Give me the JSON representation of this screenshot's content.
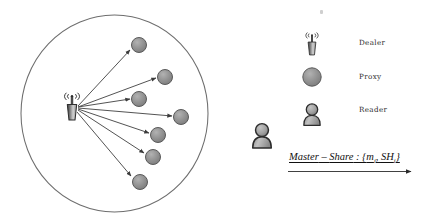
{
  "diagram": {
    "coverage_area": {
      "name": "dealer-coverage-circle",
      "cx": 114.5,
      "cy": 113.5,
      "rx": 93.5,
      "ry": 98.5,
      "stroke": "#6e6e6e",
      "fill": "#ffffff"
    },
    "dealer": {
      "label": "Dealer",
      "x": 72,
      "y": 108,
      "icon": "radio-tower-icon"
    },
    "proxies": {
      "label": "Proxy",
      "icon": "proxy-circle-icon",
      "fill": "#8d8d8d",
      "stroke": "#5a5a5a",
      "radius": 7.5,
      "nodes": [
        {
          "id": "proxy-1",
          "x": 139,
          "y": 45
        },
        {
          "id": "proxy-2",
          "x": 165,
          "y": 77
        },
        {
          "id": "proxy-3",
          "x": 139,
          "y": 99
        },
        {
          "id": "proxy-4",
          "x": 181,
          "y": 117
        },
        {
          "id": "proxy-5",
          "x": 158,
          "y": 135
        },
        {
          "id": "proxy-6",
          "x": 153,
          "y": 157
        },
        {
          "id": "proxy-7",
          "x": 140,
          "y": 182
        }
      ]
    },
    "reader": {
      "label": "Reader",
      "icon": "person-icon",
      "x": 262,
      "y": 134,
      "fill": "#9d9d9d",
      "stroke": "#3a3a3a"
    },
    "legend": {
      "name": "legend",
      "items": [
        {
          "key": "dealer",
          "label": "Dealer",
          "icon": "radio-tower-icon",
          "icon_x": 312,
          "icon_y": 45,
          "label_x": 359,
          "label_y": 42
        },
        {
          "key": "proxy",
          "label": "Proxy",
          "icon": "proxy-circle-icon",
          "icon_x": 312,
          "icon_y": 77,
          "label_x": 359,
          "label_y": 75
        },
        {
          "key": "reader",
          "label": "Reader",
          "icon": "person-icon",
          "icon_x": 312,
          "icon_y": 115,
          "label_x": 359,
          "label_y": 108
        }
      ]
    },
    "annotation": {
      "name": "master-share-annotation",
      "text_plain": "Master − Share : {mᵢ, SHᵢ}",
      "parts": {
        "master": "Master",
        "dash": " – ",
        "share": "Share",
        "colon": " : {",
        "m": "m",
        "sub1": "i",
        "comma": ", ",
        "sh": "SH",
        "sub2": "i",
        "close": "}"
      },
      "arrow": {
        "x1": 288,
        "y1": 172,
        "x2": 413,
        "y2": 172,
        "stroke": "#2b2b2b"
      }
    },
    "arrows": {
      "name": "dealer-to-proxy-arrows",
      "stroke": "#4a4a4a",
      "count": 7
    },
    "speck": {
      "name": "artifact-speck",
      "x": 320,
      "y": 10
    }
  },
  "colors": {
    "circle_stroke": "#6e6e6e",
    "node_fill": "#8d8d8d",
    "node_stroke": "#5a5a5a",
    "arrow": "#4a4a4a",
    "text": "#2b2b2b",
    "background": "#ffffff"
  }
}
